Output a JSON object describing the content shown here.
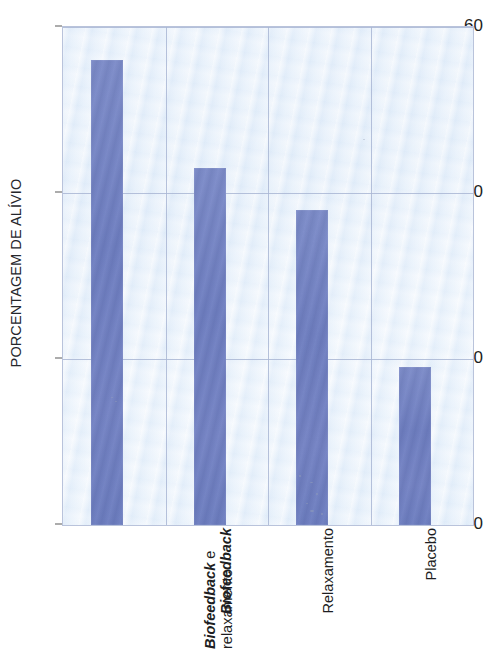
{
  "chart_data": {
    "type": "bar",
    "title": "",
    "subtitle": "",
    "xlabel": "",
    "ylabel": "PORCENTAGEM DE ALÍVIO",
    "categories": [
      "Biofeedback e relaxamento",
      "Biofeedback",
      "Relaxamento",
      "Placebo"
    ],
    "category_lines": [
      [
        "Biofeedback e",
        "relaxamento"
      ],
      [
        "Biofeedback"
      ],
      [
        "Relaxamento"
      ],
      [
        "Placebo"
      ]
    ],
    "values": [
      56,
      43,
      38,
      19
    ],
    "ylim": [
      0,
      60
    ],
    "ytick_labels": [
      "0",
      "20",
      "40",
      "60"
    ],
    "ytick_values": [
      0,
      20,
      40,
      60
    ],
    "grid": "horizontal-and-vertical",
    "legend": "none",
    "bar_color": "#6d7dc0",
    "plot_background_color": "#e6eef8",
    "grid_color": "#a9b6d4",
    "axis_color": "#b9c3db",
    "text_color": "#1d1e22",
    "italic_categories": [
      0,
      1
    ]
  },
  "figure": {
    "clipped_title_fragment": "·"
  }
}
